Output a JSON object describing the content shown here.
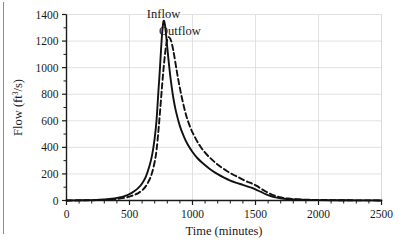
{
  "chart_data": {
    "type": "line",
    "title": "",
    "xlabel": "Time (minutes)",
    "ylabel": "Flow (ft3/s)",
    "ylabel_base": "Flow (ft",
    "ylabel_sup": "3",
    "ylabel_tail": "/s)",
    "xlim": [
      0,
      2500
    ],
    "ylim": [
      0,
      1400
    ],
    "xticks": [
      0,
      500,
      1000,
      1500,
      2000,
      2500
    ],
    "yticks": [
      0,
      200,
      400,
      600,
      800,
      1000,
      1200,
      1400
    ],
    "xtick_labels": [
      "0",
      "500",
      "1000",
      "1500",
      "2000",
      "2500"
    ],
    "ytick_labels": [
      "0",
      "200",
      "400",
      "600",
      "800",
      "1000",
      "1200",
      "1400"
    ],
    "x_minor_interval": 100,
    "y_minor_interval": 100,
    "grid": "horizontal",
    "grid_color": "#d9d9d9",
    "legend_position": "inline-annotation",
    "axis_color": "#1a1a1a",
    "series": [
      {
        "name": "Inflow",
        "style": "solid",
        "color": "#111111",
        "label_x": 770,
        "label_y": 1400,
        "peak_x": 770,
        "peak_y": 1350,
        "x": [
          0,
          60,
          120,
          180,
          240,
          300,
          340,
          380,
          420,
          460,
          500,
          540,
          570,
          600,
          630,
          660,
          680,
          700,
          715,
          730,
          740,
          750,
          760,
          770,
          780,
          790,
          800,
          815,
          830,
          850,
          870,
          900,
          930,
          960,
          1000,
          1040,
          1080,
          1120,
          1160,
          1200,
          1250,
          1300,
          1350,
          1400,
          1440,
          1470,
          1500,
          1540,
          1580,
          1620,
          1660,
          1700,
          1750,
          1800,
          1900,
          2000,
          2100,
          2200,
          2300,
          2400,
          2500
        ],
        "y": [
          0,
          1,
          2,
          3,
          5,
          8,
          11,
          16,
          23,
          33,
          48,
          72,
          95,
          128,
          180,
          265,
          345,
          470,
          610,
          830,
          970,
          1130,
          1270,
          1350,
          1330,
          1250,
          1150,
          1010,
          890,
          760,
          665,
          560,
          485,
          425,
          365,
          318,
          282,
          250,
          222,
          198,
          172,
          150,
          133,
          118,
          105,
          96,
          84,
          66,
          48,
          34,
          24,
          17,
          11,
          8,
          5,
          3,
          2,
          2,
          1,
          1,
          0
        ]
      },
      {
        "name": "Outflow",
        "style": "dashed",
        "color": "#111111",
        "label_x": 900,
        "label_y": 1265,
        "peak_x": 812,
        "peak_y": 1230,
        "x": [
          0,
          60,
          120,
          180,
          240,
          300,
          340,
          380,
          420,
          460,
          500,
          540,
          570,
          600,
          630,
          660,
          680,
          700,
          715,
          730,
          745,
          760,
          775,
          790,
          800,
          812,
          825,
          840,
          855,
          875,
          895,
          920,
          950,
          985,
          1020,
          1060,
          1100,
          1140,
          1180,
          1220,
          1270,
          1320,
          1370,
          1410,
          1450,
          1480,
          1510,
          1545,
          1585,
          1625,
          1665,
          1705,
          1755,
          1805,
          1900,
          2000,
          2100,
          2200,
          2300,
          2400,
          2500
        ],
        "y": [
          0,
          0,
          1,
          2,
          3,
          5,
          7,
          10,
          14,
          20,
          29,
          43,
          56,
          76,
          108,
          160,
          212,
          292,
          382,
          530,
          700,
          880,
          1040,
          1165,
          1210,
          1230,
          1215,
          1165,
          1090,
          975,
          870,
          755,
          640,
          545,
          475,
          410,
          360,
          320,
          286,
          256,
          224,
          196,
          172,
          152,
          136,
          124,
          110,
          88,
          66,
          47,
          33,
          23,
          15,
          10,
          6,
          4,
          3,
          2,
          1,
          1,
          0
        ]
      }
    ]
  }
}
